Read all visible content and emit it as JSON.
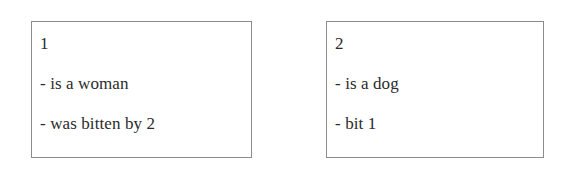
{
  "page": {
    "background_color": "#ffffff",
    "width": 561,
    "height": 174
  },
  "style": {
    "box_border_color": "#8c8c8c",
    "box_background_color": "#ffffff",
    "text_color": "#2b2b2b",
    "bullet_marker": "-"
  },
  "boxes": [
    {
      "entity_id": "1",
      "facts": [
        "is a woman",
        "was bitten by 2"
      ],
      "bullets": [
        "-",
        "-"
      ]
    },
    {
      "entity_id": "2",
      "facts": [
        "is a dog",
        "bit 1"
      ],
      "bullets": [
        "-",
        "-"
      ]
    }
  ]
}
